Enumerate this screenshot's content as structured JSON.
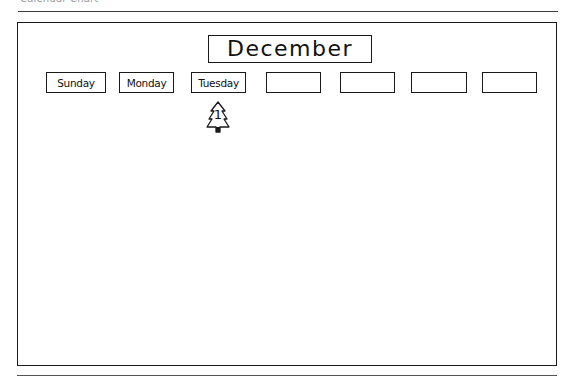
{
  "caption": "Calendar Chart",
  "calendar": {
    "month": "December",
    "days": [
      {
        "label": "Sunday",
        "x": 46,
        "w": 60
      },
      {
        "label": "Monday",
        "x": 119,
        "w": 55
      },
      {
        "label": "Tuesday",
        "x": 191,
        "w": 55
      },
      {
        "label": "",
        "x": 266,
        "w": 55
      },
      {
        "label": "",
        "x": 340,
        "w": 55
      },
      {
        "label": "",
        "x": 411,
        "w": 56
      },
      {
        "label": "",
        "x": 482,
        "w": 55
      }
    ],
    "dates": [
      {
        "day_index": 2,
        "number": "1",
        "marker": "tree-icon"
      }
    ]
  },
  "colors": {
    "ink": "#1a1a1a",
    "background": "#ffffff",
    "caption": "#9a9a9a"
  }
}
